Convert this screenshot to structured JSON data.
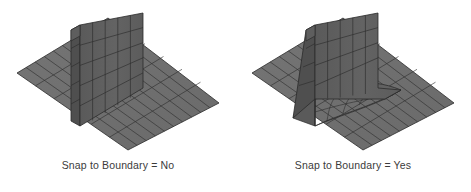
{
  "background_color": "#ffffff",
  "figures": [
    {
      "id": "snap-to-boundary-no",
      "caption": "Snap to Boundary  =  No",
      "label_text": "Snap to Boundary",
      "separator": "=",
      "value": "No",
      "description": "Isometric quad mesh: flat ground plane with a vertical wall meeting the floor at a sharp right-angle corner; no transition elements."
    },
    {
      "id": "snap-to-boundary-yes",
      "caption": "Snap to Boundary  =  Yes",
      "label_text": "Snap to Boundary",
      "separator": "=",
      "value": "Yes",
      "description": "Isometric quad mesh: flat ground plane with a vertical wall whose base flares out into a smooth curved fillet that blends into the floor."
    }
  ],
  "colors": {
    "floor_fill": "#6f6f6f",
    "floor_fill_far": "#737373",
    "wall_fill": "#5f5f5f",
    "wall_fill_shadow": "#565656",
    "fillet_fill": "#676767",
    "grid_line": "#2e2e2e",
    "outline": "#2a2a2a",
    "caption_text": "#3b3b3b",
    "background": "#ffffff"
  },
  "mesh": {
    "floor_grid_columns": 10,
    "floor_grid_rows": 6,
    "wall_grid_columns": 5,
    "wall_grid_rows": 5,
    "projection": "isometric"
  }
}
